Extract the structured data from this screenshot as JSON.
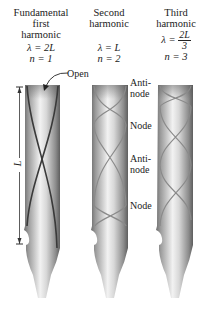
{
  "columns": [
    {
      "title_lines": [
        "Fundamental",
        "first",
        "harmonic"
      ],
      "wavelength": "λ = 2L",
      "n": "n = 1"
    },
    {
      "title_lines": [
        "Second",
        "harmonic"
      ],
      "wavelength": "λ = L",
      "n": "n = 2"
    },
    {
      "title_lines": [
        "Third",
        "harmonic"
      ],
      "wavelength_prefix": "λ =",
      "wavelength_num": "2L",
      "wavelength_den": "3",
      "n": "n = 3"
    }
  ],
  "annotations": {
    "open": "Open",
    "length": "L",
    "antinode_1": [
      "Anti-",
      "node"
    ],
    "node_1": "Node",
    "antinode_2": [
      "Anti-",
      "node"
    ],
    "node_2": "Node"
  },
  "colors": {
    "pipe_dark": "#6e6e6e",
    "pipe_light": "#f2f2f2",
    "wave_line_1": "#3a3a3a",
    "wave_line_other": "#8a8a8a"
  }
}
